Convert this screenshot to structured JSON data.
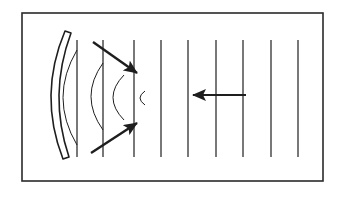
{
  "diagram": {
    "colors": {
      "ink": "#1e1e1e",
      "background": "#ffffff",
      "frame": "#2a2a2a"
    },
    "frame": {
      "x": 22,
      "y": 13,
      "width": 301,
      "height": 168
    },
    "plane_wavefronts": {
      "x_positions": [
        77,
        103,
        134,
        161,
        188,
        216,
        243,
        271,
        298
      ],
      "y_top": 40,
      "y_bottom": 157
    },
    "incident_arrow": {
      "from": [
        246,
        95
      ],
      "to": [
        193,
        95
      ],
      "direction": "left"
    },
    "mirror": {
      "type": "concave",
      "top": [
        65,
        31
      ],
      "bottom": [
        63,
        159
      ],
      "bulge_x": 52,
      "thickness": 8
    },
    "reflected_wavefronts": [
      {
        "x_top": 77,
        "y_top": 50,
        "x_bottom": 77,
        "y_bottom": 145,
        "bulge_x": 63
      },
      {
        "x_top": 103,
        "y_top": 63,
        "x_bottom": 103,
        "y_bottom": 130,
        "bulge_x": 91
      },
      {
        "x_top": 124,
        "y_top": 75,
        "x_bottom": 124,
        "y_bottom": 120,
        "bulge_x": 113
      },
      {
        "x_top": 145,
        "y_top": 91,
        "x_bottom": 145,
        "y_bottom": 105,
        "bulge_x": 140
      }
    ],
    "converging_arrows": [
      {
        "from": [
          93,
          42
        ],
        "to": [
          137,
          73
        ],
        "label": "reflected ray top"
      },
      {
        "from": [
          91,
          153
        ],
        "to": [
          137,
          123
        ],
        "label": "reflected ray bottom"
      }
    ]
  }
}
